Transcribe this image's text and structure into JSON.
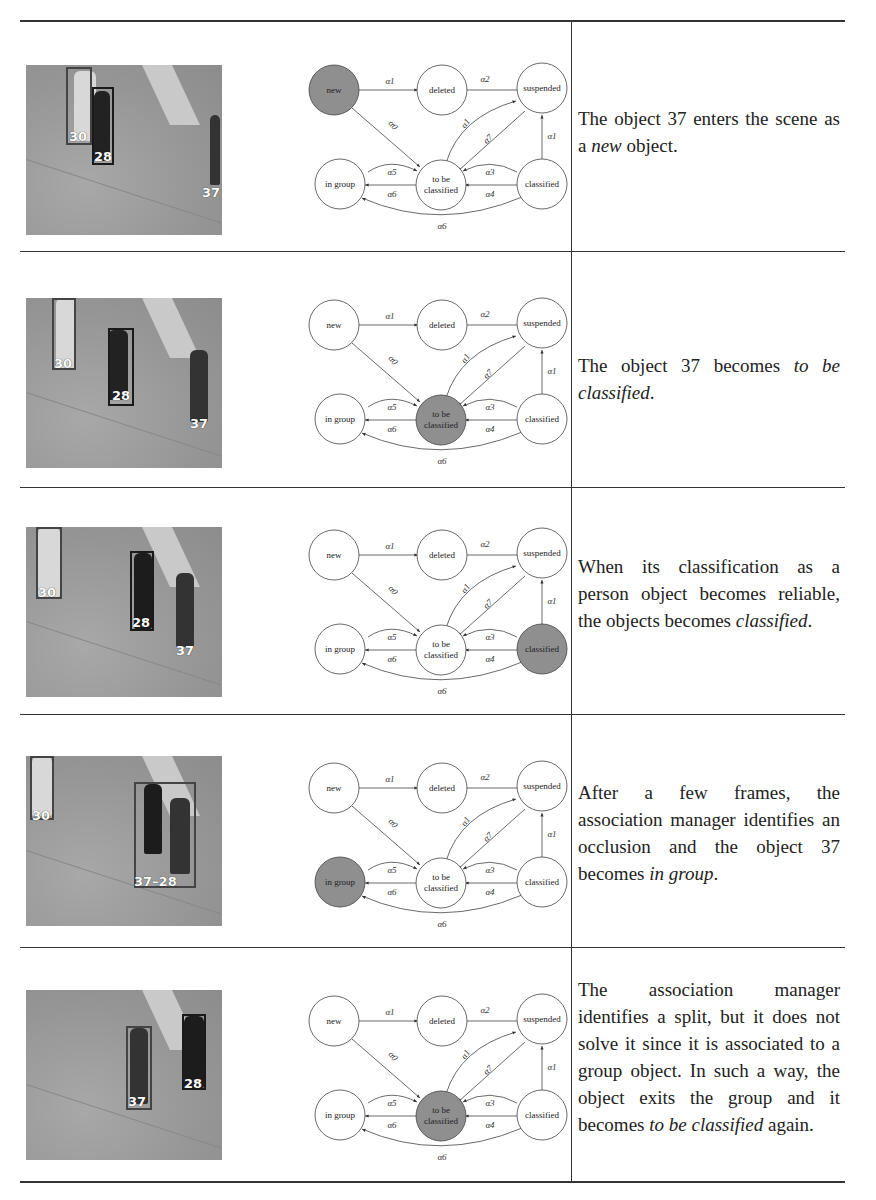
{
  "table": {
    "rows": [
      {
        "photo": {
          "labels": [
            "30",
            "28",
            "37"
          ]
        },
        "highlighted_state": "new",
        "description": {
          "before": "The object 37 enters the scene as a ",
          "emphasis": "new",
          "after": " object."
        }
      },
      {
        "photo": {
          "labels": [
            "30",
            "28",
            "37"
          ]
        },
        "highlighted_state": "to be classified",
        "description": {
          "before": "The object 37 becomes ",
          "emphasis": "to be classified",
          "after": "."
        }
      },
      {
        "photo": {
          "labels": [
            "30",
            "28",
            "37"
          ]
        },
        "highlighted_state": "classified",
        "description": {
          "before": "When its classification as a person object becomes reliable, the objects becomes ",
          "emphasis": "classified",
          "after": "."
        }
      },
      {
        "photo": {
          "labels": [
            "30",
            "37–28"
          ]
        },
        "highlighted_state": "in group",
        "description": {
          "before": "After a few frames, the association manager identifies an occlusion and the object 37 becomes ",
          "emphasis": "in group",
          "after": "."
        }
      },
      {
        "photo": {
          "labels": [
            "37",
            "28"
          ]
        },
        "highlighted_state": "to be classified",
        "description": {
          "before": "The association manager identifies a split, but it does not solve it since it is associated to a group object. In such a way, the object exits the group and it becomes ",
          "emphasis": "to be classified",
          "after": " again."
        }
      }
    ]
  },
  "state_diagram": {
    "states": {
      "new": "new",
      "deleted": "deleted",
      "suspended": "suspended",
      "in_group": "in group",
      "to_be_classified_1": "to be",
      "to_be_classified_2": "classified",
      "classified": "classified"
    },
    "transitions": {
      "new_deleted": "α1",
      "suspended_deleted": "α2",
      "new_tbc": "α0",
      "tbc_suspended": "α1",
      "suspended_tbc": "α7",
      "classified_suspended": "α1",
      "ingroup_tbc": "α5",
      "tbc_ingroup": "α6",
      "classified_tbc_top": "α3",
      "tbc_classified_bottom": "α4",
      "classified_ingroup": "α6"
    },
    "highlight_color": "#8f8f8f"
  }
}
